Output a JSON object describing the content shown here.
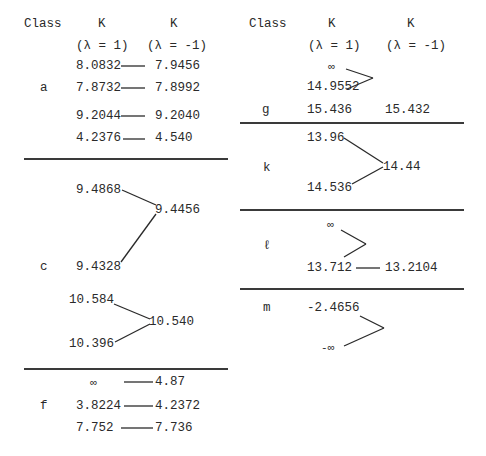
{
  "headers": {
    "class": "Class",
    "k": "K",
    "lambda_pos": "(λ = 1)",
    "lambda_neg": "(λ = -1)"
  },
  "left": {
    "a": {
      "label": "a",
      "rows": [
        {
          "k1": "8.0832",
          "k2": "7.9456"
        },
        {
          "k1": "7.8732",
          "k2": "7.8992"
        },
        {
          "k1": "9.2044",
          "k2": "9.2040"
        },
        {
          "k1": "4.2376",
          "k2": "4.540"
        }
      ]
    },
    "c": {
      "label": "c",
      "group1": {
        "k1_top": "9.4868",
        "k2": "9.4456",
        "k1_bottom": "9.4328"
      },
      "group2": {
        "k1_top": "10.584",
        "k2": "10.540",
        "k1_bottom": "10.396"
      }
    },
    "f": {
      "label": "f",
      "rows": [
        {
          "k1": "∞",
          "k2": "4.87"
        },
        {
          "k1": "3.8224",
          "k2": "4.2372"
        },
        {
          "k1": "7.752",
          "k2": "7.736"
        }
      ]
    }
  },
  "right": {
    "g": {
      "label": "g",
      "inf": "∞",
      "k1_a": "14.9552",
      "k1_b": "15.436",
      "k2_b": "15.432"
    },
    "k": {
      "label": "k",
      "k1_top": "13.96",
      "k2": "14.44",
      "k1_bottom": "14.536"
    },
    "l": {
      "label": "ℓ",
      "inf": "∞",
      "k1": "13.712",
      "k2": "13.2104"
    },
    "m": {
      "label": "m",
      "k1_top": "-2.4656",
      "k1_bottom": "-∞"
    }
  }
}
